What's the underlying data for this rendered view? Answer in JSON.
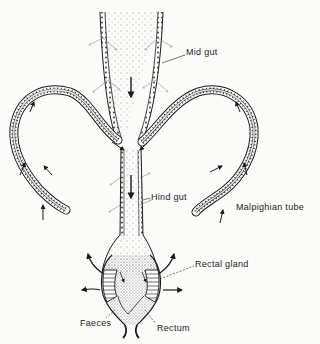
{
  "diagram": {
    "labels": {
      "mid_gut": "Mid gut",
      "hind_gut": "Hind gut",
      "malpighian_tube": "Malpighian tube",
      "rectal_gland": "Rectal gland",
      "faeces": "Faeces",
      "rectum": "Rectum"
    },
    "colors": {
      "ink": "#1a1a1a",
      "stipple": "#777777",
      "background": "#fbfbfa"
    }
  }
}
